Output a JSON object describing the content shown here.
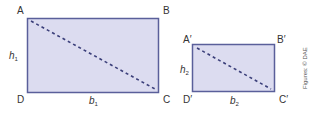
{
  "figure": {
    "colors": {
      "fill": "#dcdcf0",
      "stroke": "#5a5f9a",
      "diagonal": "#3b3f7a",
      "text": "#333333"
    },
    "rect1": {
      "vertices": {
        "top_left": "A",
        "top_right": "B",
        "bottom_right": "C",
        "bottom_left": "D"
      },
      "height_label": {
        "var": "h",
        "sub": "1"
      },
      "base_label": {
        "var": "b",
        "sub": "1"
      }
    },
    "rect2": {
      "vertices": {
        "top_left": "A′",
        "top_right": "B′",
        "bottom_right": "C′",
        "bottom_left": "D′"
      },
      "height_label": {
        "var": "h",
        "sub": "2"
      },
      "base_label": {
        "var": "b",
        "sub": "2"
      }
    },
    "credit": "Figures: © DAE"
  }
}
